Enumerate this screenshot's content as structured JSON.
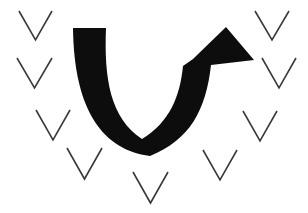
{
  "figure": {
    "title": "U-Turn Arrow with Chevron Marks",
    "alt_text": "A thick black arrow curving downward in a U shape and rising to an upward-pointing arrowhead, surrounded by ten thin downward chevron marks.",
    "background_color": "#ffffff",
    "width": 308,
    "height": 213
  },
  "arrow": {
    "name": "u-turn-arrow",
    "description": "Thick black U-shaped arrow descending on the left, curving along the bottom, and ascending on the right to an upward arrowhead",
    "fill_color": "#0d0d0d",
    "direction": "up",
    "tail_start": {
      "x": 73,
      "y": 28
    },
    "tip": {
      "x": 226,
      "y": 27
    },
    "barb_left": {
      "x": 193,
      "y": 59
    },
    "barb_right": {
      "x": 254,
      "y": 60
    },
    "bottom_of_curve": {
      "x": 140,
      "y": 152
    },
    "path": "M 73,28 L 106,28 C 104,78 110,118 142,139 C 170,122 180,96 183,66 L 193,59 L 226,27 L 254,60 L 211,65 C 206,110 190,140 150,156 C 104,150 74,112 73,28 Z"
  },
  "chevrons": {
    "name": "chevron-marks",
    "stroke_color": "#3a3a3a",
    "stroke_width": 1.6,
    "count": 10,
    "orientation": "pointing-down",
    "items": [
      {
        "id": "chevron-top-left",
        "left": 19,
        "top": 11,
        "width": 33,
        "height": 29
      },
      {
        "id": "chevron-upper-left",
        "left": 17,
        "top": 58,
        "width": 35,
        "height": 30
      },
      {
        "id": "chevron-mid-left",
        "left": 36,
        "top": 110,
        "width": 34,
        "height": 30
      },
      {
        "id": "chevron-lower-left",
        "left": 67,
        "top": 148,
        "width": 35,
        "height": 31
      },
      {
        "id": "chevron-bottom-center",
        "left": 133,
        "top": 172,
        "width": 35,
        "height": 31
      },
      {
        "id": "chevron-lower-right",
        "left": 203,
        "top": 150,
        "width": 34,
        "height": 30
      },
      {
        "id": "chevron-mid-right",
        "left": 243,
        "top": 111,
        "width": 34,
        "height": 30
      },
      {
        "id": "chevron-upper-right",
        "left": 262,
        "top": 58,
        "width": 34,
        "height": 30
      },
      {
        "id": "chevron-top-right",
        "left": 255,
        "top": 11,
        "width": 34,
        "height": 29
      },
      {
        "id": "chevron-bottom-left-inner",
        "left": 103,
        "top": 148,
        "width": 0,
        "height": 0
      }
    ]
  }
}
